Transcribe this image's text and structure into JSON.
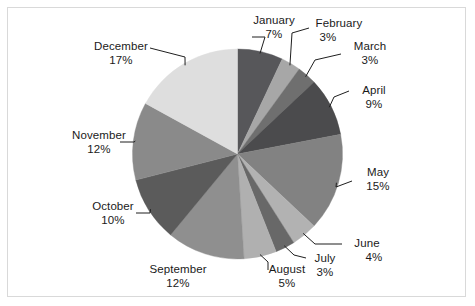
{
  "chart_data": {
    "type": "pie",
    "title": "",
    "subtitle": "",
    "xlabel": "",
    "ylabel": "",
    "legend_position": "none",
    "grid": false,
    "labels_show_name": true,
    "labels_show_percent": true,
    "start_angle_deg": 0,
    "direction": "clockwise",
    "categories": [
      "January",
      "February",
      "March",
      "April",
      "May",
      "June",
      "July",
      "August",
      "September",
      "October",
      "November",
      "December"
    ],
    "values": [
      7,
      3,
      3,
      9,
      15,
      4,
      3,
      5,
      12,
      10,
      12,
      17
    ],
    "value_labels": [
      "7%",
      "3%",
      "3%",
      "9%",
      "15%",
      "4%",
      "3%",
      "5%",
      "12%",
      "10%",
      "12%",
      "17%"
    ],
    "value_unit": "%",
    "total": 100,
    "slice_colors": [
      "#57575a",
      "#a7a7a7",
      "#6f6f6f",
      "#4b4b4d",
      "#828282",
      "#b2b2b2",
      "#686868",
      "#b0b0b0",
      "#8f8f8f",
      "#5b5b5b",
      "#8a8a8a",
      "#dedede"
    ],
    "slices": [
      {
        "name": "January",
        "percent": 7,
        "percent_label": "7%",
        "color": "#57575a"
      },
      {
        "name": "February",
        "percent": 3,
        "percent_label": "3%",
        "color": "#a7a7a7"
      },
      {
        "name": "March",
        "percent": 3,
        "percent_label": "3%",
        "color": "#6f6f6f"
      },
      {
        "name": "April",
        "percent": 9,
        "percent_label": "9%",
        "color": "#4b4b4d"
      },
      {
        "name": "May",
        "percent": 15,
        "percent_label": "15%",
        "color": "#828282"
      },
      {
        "name": "June",
        "percent": 4,
        "percent_label": "4%",
        "color": "#b2b2b2"
      },
      {
        "name": "July",
        "percent": 3,
        "percent_label": "3%",
        "color": "#686868"
      },
      {
        "name": "August",
        "percent": 5,
        "percent_label": "5%",
        "color": "#b0b0b0"
      },
      {
        "name": "September",
        "percent": 12,
        "percent_label": "12%",
        "color": "#8f8f8f"
      },
      {
        "name": "October",
        "percent": 10,
        "percent_label": "10%",
        "color": "#5b5b5b"
      },
      {
        "name": "November",
        "percent": 12,
        "percent_label": "12%",
        "color": "#8a8a8a"
      },
      {
        "name": "December",
        "percent": 17,
        "percent_label": "17%",
        "color": "#dedede"
      }
    ]
  },
  "frame": {
    "border_color": "#d9d9d9",
    "background": "#ffffff"
  },
  "leader_line_color": "#1f1f1f"
}
